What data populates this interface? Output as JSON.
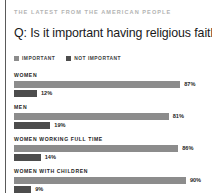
{
  "kicker": "THE LATEST FROM THE AMERICAN PEOPLE",
  "title": "Q: Is it important having religious faith?",
  "colors": {
    "important": "#8c8c8c",
    "not_important": "#4d4d4d",
    "rule": "#5a5a5a",
    "kicker_text": "#b3b3b3",
    "title_text": "#1a1a1a",
    "background": "#ffffff"
  },
  "legend": [
    {
      "label": "IMPORTANT",
      "color": "#8c8c8c",
      "swatch_name": "legend-swatch-important"
    },
    {
      "label": "NOT IMPORTANT",
      "color": "#4d4d4d",
      "swatch_name": "legend-swatch-not-important"
    }
  ],
  "chart_data": {
    "type": "bar",
    "title": "Q: Is it important having religious faith?",
    "subtitle": "THE LATEST FROM THE AMERICAN PEOPLE",
    "orientation": "horizontal",
    "categories": [
      "WOMEN",
      "MEN",
      "WOMEN WORKING FULL TIME",
      "WOMEN WITH CHILDREN"
    ],
    "series": [
      {
        "name": "IMPORTANT",
        "values": [
          87,
          81,
          86,
          90
        ],
        "color": "#8c8c8c"
      },
      {
        "name": "NOT IMPORTANT",
        "values": [
          12,
          19,
          14,
          9
        ],
        "color": "#4d4d4d"
      }
    ],
    "value_labels": [
      [
        "87%",
        "12%"
      ],
      [
        "81%",
        "19%"
      ],
      [
        "86%",
        "14%"
      ],
      [
        "90%",
        "9%"
      ]
    ],
    "xlabel": "",
    "ylabel": "",
    "xlim": [
      0,
      100
    ],
    "unit": "%",
    "grid": false,
    "legend_position": "top"
  },
  "groups": [
    {
      "label": "WOMEN",
      "bars": [
        {
          "series": "IMPORTANT",
          "value": 87,
          "value_label": "87%",
          "color": "#8c8c8c"
        },
        {
          "series": "NOT IMPORTANT",
          "value": 12,
          "value_label": "12%",
          "color": "#4d4d4d"
        }
      ]
    },
    {
      "label": "MEN",
      "bars": [
        {
          "series": "IMPORTANT",
          "value": 81,
          "value_label": "81%",
          "color": "#8c8c8c"
        },
        {
          "series": "NOT IMPORTANT",
          "value": 19,
          "value_label": "19%",
          "color": "#4d4d4d"
        }
      ]
    },
    {
      "label": "WOMEN WORKING FULL TIME",
      "bars": [
        {
          "series": "IMPORTANT",
          "value": 86,
          "value_label": "86%",
          "color": "#8c8c8c"
        },
        {
          "series": "NOT IMPORTANT",
          "value": 14,
          "value_label": "14%",
          "color": "#4d4d4d"
        }
      ]
    },
    {
      "label": "WOMEN WITH CHILDREN",
      "bars": [
        {
          "series": "IMPORTANT",
          "value": 90,
          "value_label": "90%",
          "color": "#8c8c8c"
        },
        {
          "series": "NOT IMPORTANT",
          "value": 9,
          "value_label": "9%",
          "color": "#4d4d4d"
        }
      ]
    }
  ]
}
